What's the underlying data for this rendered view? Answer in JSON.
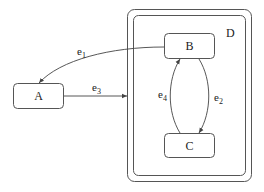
{
  "diagram": {
    "type": "statechart",
    "states": {
      "A": {
        "label": "A"
      },
      "B": {
        "label": "B"
      },
      "C": {
        "label": "C"
      },
      "D": {
        "label": "D"
      }
    },
    "transitions": [
      {
        "id": "e1",
        "base": "e",
        "sub": "1",
        "from": "B",
        "to": "A"
      },
      {
        "id": "e2",
        "base": "e",
        "sub": "2",
        "from": "B",
        "to": "C"
      },
      {
        "id": "e3",
        "base": "e",
        "sub": "3",
        "from": "A",
        "to": "D"
      },
      {
        "id": "e4",
        "base": "e",
        "sub": "4",
        "from": "C",
        "to": "B"
      }
    ],
    "colors": {
      "stroke": "#444444",
      "background": "#ffffff"
    }
  }
}
